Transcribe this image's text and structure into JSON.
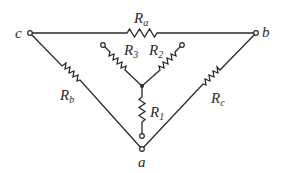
{
  "diagram": {
    "type": "delta-wye resistor network",
    "line_color": "#2a2a2a",
    "nodes": {
      "a": {
        "label": "a"
      },
      "b": {
        "label": "b"
      },
      "c": {
        "label": "c"
      }
    },
    "resistors": {
      "Ra": {
        "main": "R",
        "sub": "a"
      },
      "Rb": {
        "main": "R",
        "sub": "b"
      },
      "Rc": {
        "main": "R",
        "sub": "c"
      },
      "R1": {
        "main": "R",
        "sub": "1"
      },
      "R2": {
        "main": "R",
        "sub": "2"
      },
      "R3": {
        "main": "R",
        "sub": "3"
      }
    }
  }
}
